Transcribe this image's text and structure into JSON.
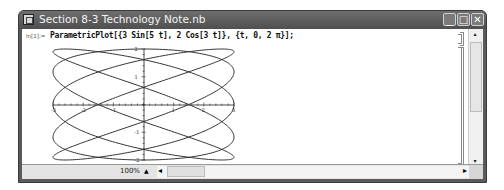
{
  "window": {
    "title": "Section 8-3 Technology Note.nb",
    "buttons": {
      "minimize": "_",
      "maximize": "□",
      "close": "✕"
    }
  },
  "notebook": {
    "input_label": "In[1]:=",
    "input_code": "ParametricPlot[{3 Sin[5 t], 2 Cos[3 t]}, {t, 0, 2 π}];"
  },
  "statusbar": {
    "zoom": "100%",
    "zoom_up_icon": "▲",
    "scroll_left_icon": "◂",
    "scroll_right_icon": "▸"
  },
  "scrollbar": {
    "up_icon": "▴",
    "down_icon": "▾"
  },
  "chart_data": {
    "type": "line",
    "title": "",
    "x_expr": "3 Sin[5 t]",
    "y_expr": "2 Cos[3 t]",
    "t_range": [
      0,
      6.283
    ],
    "xlim": [
      -3,
      3
    ],
    "ylim": [
      -2,
      2
    ],
    "x_ticks": [
      "-3",
      "-2",
      "-1",
      "1",
      "2",
      "3"
    ],
    "y_ticks": [
      "-2",
      "-1",
      "1",
      "2"
    ],
    "grid": false,
    "curve_color": "#333333"
  }
}
